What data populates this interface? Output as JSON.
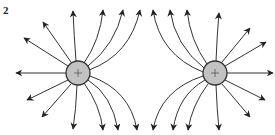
{
  "figure": {
    "label": "2",
    "line_color": "#333333",
    "charge_fill": "#c2c2c2"
  },
  "charges": [
    {
      "name": "left-charge",
      "sign": "+",
      "cx": 78,
      "cy": 73,
      "r": 12
    },
    {
      "name": "right-charge",
      "sign": "+",
      "cx": 215,
      "cy": 73,
      "r": 12
    }
  ],
  "field_lines": [
    {
      "charge": 0,
      "d": "M66,73 L16,73"
    },
    {
      "charge": 0,
      "d": "M68,66 L24,38"
    },
    {
      "charge": 0,
      "d": "M71,62 L43,22"
    },
    {
      "charge": 0,
      "d": "M76,61 Q74,35 73,11"
    },
    {
      "charge": 0,
      "d": "M68,80 L27,100"
    },
    {
      "charge": 0,
      "d": "M71,84 L42,117"
    },
    {
      "charge": 0,
      "d": "M77,85 Q76,110 73,129"
    },
    {
      "charge": 0,
      "d": "M84,63 Q100,40 103,10"
    },
    {
      "charge": 0,
      "d": "M88,66 Q115,45 123,10"
    },
    {
      "charge": 0,
      "d": "M89,70 Q130,55 140,10"
    },
    {
      "charge": 0,
      "d": "M84,83 Q100,105 103,130"
    },
    {
      "charge": 0,
      "d": "M88,80 Q112,95 118,130"
    },
    {
      "charge": 0,
      "d": "M90,76 Q130,90 137,130"
    },
    {
      "charge": 1,
      "d": "M227,73 L273,73"
    },
    {
      "charge": 1,
      "d": "M225,66 L266,42"
    },
    {
      "charge": 1,
      "d": "M222,62 L250,28"
    },
    {
      "charge": 1,
      "d": "M216,61 Q217,35 219,13"
    },
    {
      "charge": 1,
      "d": "M225,80 L265,100"
    },
    {
      "charge": 1,
      "d": "M222,84 L250,117"
    },
    {
      "charge": 1,
      "d": "M216,85 Q217,110 219,130"
    },
    {
      "charge": 1,
      "d": "M207,64 Q190,40 187,10"
    },
    {
      "charge": 1,
      "d": "M204,68 Q175,45 170,10"
    },
    {
      "charge": 1,
      "d": "M203,72 Q160,55 153,10"
    },
    {
      "charge": 1,
      "d": "M208,84 Q192,105 188,130"
    },
    {
      "charge": 1,
      "d": "M205,80 Q178,95 173,130"
    },
    {
      "charge": 1,
      "d": "M203,76 Q160,90 153,130"
    }
  ]
}
